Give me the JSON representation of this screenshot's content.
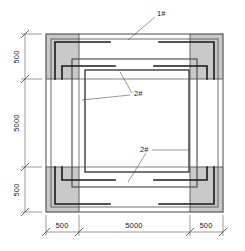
{
  "drawing": {
    "title": "structural-foundation-plan",
    "type": "plan-view",
    "colors": {
      "hatch_fill": "#c9c9c9",
      "hatch_stroke": "#8f8f8f",
      "outline": "#4a4a4a",
      "heavy_line": "#1a1a1a",
      "leader_line": "#555555",
      "dimension_line": "#555555",
      "background": "#ffffff"
    },
    "labels": {
      "tag_outer": "1#",
      "tag_inner_upper": "2#",
      "tag_inner_lower": "2#"
    },
    "dimensions": {
      "horizontal": {
        "position": "bottom",
        "segments": [
          "500",
          "5000",
          "500"
        ],
        "total": "6000"
      },
      "vertical": {
        "position": "left",
        "segments": [
          "500",
          "5000",
          "500"
        ],
        "total": "6000"
      }
    }
  }
}
